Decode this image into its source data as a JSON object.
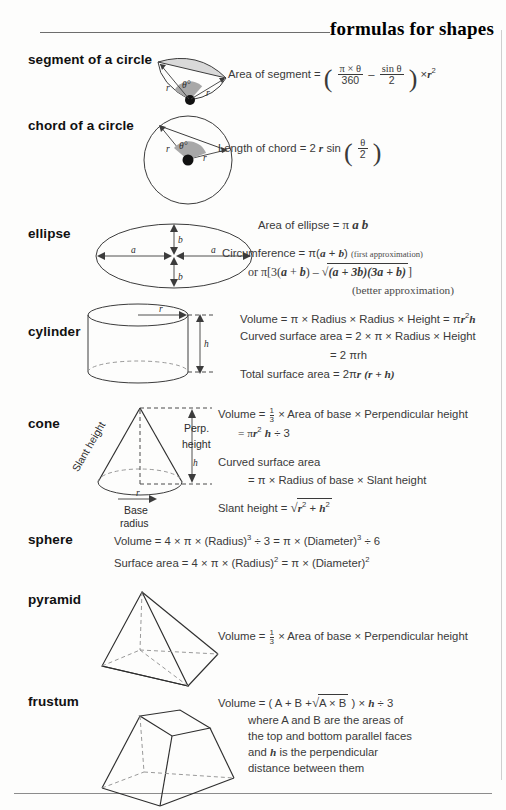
{
  "header": {
    "title": "formulas for shapes"
  },
  "sections": [
    {
      "name": "segment of a circle",
      "diagram": "circle-segment-diagram",
      "labels": {
        "r1": "r",
        "r2": "r",
        "theta": "θ°"
      },
      "formulas": [
        {
          "lead": "Area of segment =",
          "num1": "π × θ",
          "den1": "360",
          "op": "–",
          "num2": "sin θ",
          "den2": "2",
          "tail": "× r",
          "tail_sup": "2"
        }
      ]
    },
    {
      "name": "chord of a circle",
      "diagram": "circle-chord-diagram",
      "labels": {
        "r1": "r",
        "r2": "r",
        "theta": "θ°"
      },
      "formulas": [
        {
          "lead": "Length of chord  = 2 r sin",
          "num1": "θ",
          "den1": "2"
        }
      ]
    },
    {
      "name": "ellipse",
      "diagram": "ellipse-diagram",
      "labels": {
        "a_left": "a",
        "a_right": "a",
        "b_top": "b",
        "b_bottom": "b"
      },
      "formulas": [
        {
          "text": "Area of ellipse =  π a b"
        },
        {
          "text": "Circumference = π(a + b)",
          "note": "(first approximation)"
        },
        {
          "text": "or π[3(a + b) – √(a + 3b)(3a + b)]"
        },
        {
          "note_only": "(better approximation)"
        }
      ]
    },
    {
      "name": "cylinder",
      "diagram": "cylinder-diagram",
      "labels": {
        "r": "r",
        "h": "h"
      },
      "formulas": [
        {
          "text": "Volume = π × Radius × Radius × Height = πr²h"
        },
        {
          "text": "Curved surface area = 2 × π × Radius × Height"
        },
        {
          "text": "= 2 πrh"
        },
        {
          "text": "Total surface area = 2πr (r + h)"
        }
      ]
    },
    {
      "name": "cone",
      "diagram": "cone-diagram",
      "labels": {
        "slant": "Slant height",
        "perp1": "Perp.",
        "perp2": "height",
        "h": "h",
        "r": "r",
        "base1": "Base",
        "base2": "radius"
      },
      "formulas": [
        {
          "text": "Volume = 1/3 × Area of base × Perpendicular height"
        },
        {
          "text": "= πr² h ÷ 3"
        },
        {
          "text": "Curved surface area"
        },
        {
          "text": "= π × Radius of base × Slant height"
        },
        {
          "text": "Slant height = √(r² + h²)"
        }
      ]
    },
    {
      "name": "sphere",
      "diagram": "none",
      "formulas": [
        {
          "text": "Volume  =  4 × π × (Radius)³ ÷ 3 = π × (Diameter)³ ÷ 6"
        },
        {
          "text": "Surface area = 4 × π × (Radius)² = π × (Diameter)²"
        }
      ]
    },
    {
      "name": "pyramid",
      "diagram": "pyramid-diagram",
      "formulas": [
        {
          "text": "Volume = 1/3 × Area of base × Perpendicular height"
        }
      ]
    },
    {
      "name": "frustum",
      "diagram": "frustum-diagram",
      "formulas": [
        {
          "text": "Volume = ( A + B + √(A × B) ) × h ÷ 3"
        },
        {
          "text": "where A and B are the areas of"
        },
        {
          "text": "the top and bottom parallel faces"
        },
        {
          "text": "and h is the perpendicular"
        },
        {
          "text": "distance between them"
        }
      ]
    }
  ],
  "parts": {
    "area_of_segment": "Area of segment =",
    "seg_num1": "π × θ",
    "seg_den1": "360",
    "seg_minus": "–",
    "seg_num2": "sin θ",
    "seg_den2": "2",
    "seg_times": "×",
    "seg_r": "r",
    "seg_r_sup": "2",
    "chord_lead": "Length of chord",
    "chord_eq": "= 2",
    "chord_r": "r",
    "chord_sin": "sin",
    "chord_num": "θ",
    "chord_den": "2",
    "ellipse_area_lead": "Area of ellipse =",
    "ellipse_pi": "π",
    "ellipse_a": "a",
    "ellipse_b": "b",
    "ellipse_circ_lead": "Circumference = π(",
    "ellipse_circ_a": "a",
    "ellipse_circ_plus": "+",
    "ellipse_circ_b": "b",
    "ellipse_circ_close": ")",
    "ellipse_first_approx": "(first approximation)",
    "ellipse_or": "or π[3(",
    "ellipse_or_a": "a",
    "ellipse_or_b": "b",
    "ellipse_or_mid": ") – √",
    "ellipse_rad_1": "(a + 3b)(3a + b)",
    "ellipse_or_end": "]",
    "ellipse_better_approx": "(better approximation)",
    "cyl_l1_a": "Volume = π × Radius × Radius × Height = π",
    "cyl_l1_r": "r",
    "cyl_l1_sup": "2",
    "cyl_l1_h": "h",
    "cyl_l2": "Curved surface area = 2 × π × Radius × Height",
    "cyl_l3": "= 2 πrh",
    "cyl_l4_a": "Total surface area = 2π",
    "cyl_l4_r": "r",
    "cyl_l4_b": "(r + h)",
    "cone_l1_a": "Volume =",
    "cone_l1_num": "1",
    "cone_l1_den": "3",
    "cone_l1_b": "× Area of base × Perpendicular height",
    "cone_l2_a": "= π",
    "cone_l2_r": "r",
    "cone_l2_sup": "2",
    "cone_l2_h": "h",
    "cone_l2_b": "÷ 3",
    "cone_l3": "Curved surface area",
    "cone_l4": "= π × Radius of base × Slant height",
    "cone_l5_lead": "Slant height =",
    "cone_l5_rad": "√",
    "cone_l5_r": "r",
    "cone_l5_sup1": "2",
    "cone_l5_plus": "+",
    "cone_l5_h": "h",
    "cone_l5_sup2": "2",
    "sphere_l1": "Volume  =  4 × π × (Radius)",
    "sphere_l1_sup": "3",
    "sphere_l1_mid": "÷ 3 = π × (Diameter)",
    "sphere_l1_sup2": "3",
    "sphere_l1_end": "÷ 6",
    "sphere_l2": "Surface area = 4 × π × (Radius)",
    "sphere_l2_sup": "2",
    "sphere_l2_mid": "= π × (Diameter)",
    "sphere_l2_sup2": "2",
    "pyr_l1_a": "Volume =",
    "pyr_l1_num": "1",
    "pyr_l1_den": "3",
    "pyr_l1_b": "× Area of base × Perpendicular height",
    "fru_l1_a": "Volume = ( A + B +",
    "fru_l1_rad": "√",
    "fru_l1_radc": "A × B",
    "fru_l1_b": ") ×",
    "fru_l1_h": "h",
    "fru_l1_c": "÷ 3",
    "fru_l2": "where A and B are the areas of",
    "fru_l3": "the top and bottom parallel faces",
    "fru_l4_a": "and",
    "fru_l4_h": "h",
    "fru_l4_b": "is the perpendicular",
    "fru_l5": "distance between them"
  }
}
